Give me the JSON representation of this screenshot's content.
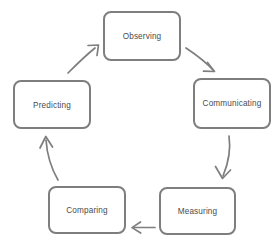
{
  "diagram": {
    "type": "cycle",
    "title": "",
    "background_color": "#ffffff",
    "box_border_color": "#7e7e7e",
    "box_fill_color": "#ffffff",
    "text_color": "#4b4b4b",
    "arrow_color": "#7e7e7e",
    "nodes": [
      {
        "id": "observing",
        "label": "Observing",
        "x": 104,
        "y": 12,
        "width": 76,
        "height": 48,
        "position": "top-center"
      },
      {
        "id": "communicating",
        "label": "Communicating",
        "x": 194,
        "y": 79,
        "width": 76,
        "height": 49,
        "position": "right-upper"
      },
      {
        "id": "measuring",
        "label": "Measuring",
        "x": 160,
        "y": 188,
        "width": 75,
        "height": 46,
        "position": "right-lower"
      },
      {
        "id": "comparing",
        "label": "Comparing",
        "x": 49,
        "y": 187,
        "width": 76,
        "height": 46,
        "position": "left-lower"
      },
      {
        "id": "predicting",
        "label": "Predicting",
        "x": 14,
        "y": 81,
        "width": 76,
        "height": 47,
        "position": "left-upper"
      }
    ],
    "edges": [
      {
        "id": "observing-to-communicating",
        "from": "observing",
        "to": "communicating",
        "style": "diagonal-down-right",
        "arrowhead": "open"
      },
      {
        "id": "communicating-to-measuring",
        "from": "communicating",
        "to": "measuring",
        "style": "curved-down",
        "arrowhead": "open"
      },
      {
        "id": "measuring-to-comparing",
        "from": "measuring",
        "to": "comparing",
        "style": "horizontal-left",
        "arrowhead": "open"
      },
      {
        "id": "comparing-to-predicting",
        "from": "comparing",
        "to": "predicting",
        "style": "curved-up",
        "arrowhead": "open"
      },
      {
        "id": "predicting-to-observing",
        "from": "predicting",
        "to": "observing",
        "style": "diagonal-up-right",
        "arrowhead": "open"
      }
    ]
  }
}
